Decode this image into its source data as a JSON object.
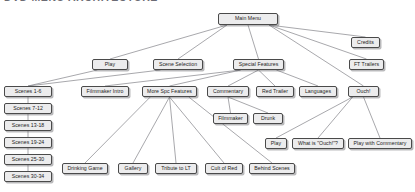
{
  "document": {
    "title_sliver": "DVD MENU ARCHITECTURE"
  },
  "theme": {
    "page_background": "#ffffff",
    "node_fill": "#ececed",
    "node_border": "#4a4a4a",
    "node_text": "#1c1c1c",
    "edge_color": "#6d6d73",
    "shadow": "#5a5a5f"
  },
  "diagram": {
    "type": "tree",
    "root": "main-menu",
    "nodes": [
      {
        "id": "main-menu",
        "label": "Main Menu",
        "x": 218,
        "y": 13,
        "w": 60,
        "h": 12
      },
      {
        "id": "play",
        "label": "Play",
        "x": 92,
        "y": 59,
        "w": 36,
        "h": 11
      },
      {
        "id": "scene-selection",
        "label": "Scene Selection",
        "x": 153,
        "y": 59,
        "w": 50,
        "h": 11
      },
      {
        "id": "special-features",
        "label": "Special Features",
        "x": 233,
        "y": 59,
        "w": 51,
        "h": 11
      },
      {
        "id": "credits",
        "label": "Credits",
        "x": 351,
        "y": 37,
        "w": 29,
        "h": 11
      },
      {
        "id": "ft-trailers",
        "label": "FT Trailers",
        "x": 349,
        "y": 59,
        "w": 35,
        "h": 11
      },
      {
        "id": "scenes-1-6",
        "label": "Scenes 1-6",
        "x": 4,
        "y": 86,
        "w": 48,
        "h": 11
      },
      {
        "id": "scenes-7-12",
        "label": "Scenes 7-12",
        "x": 4,
        "y": 103,
        "w": 48,
        "h": 11
      },
      {
        "id": "scenes-13-18",
        "label": "Scenes 13-18",
        "x": 4,
        "y": 120,
        "w": 48,
        "h": 11
      },
      {
        "id": "scenes-19-24",
        "label": "Scenes 19-24",
        "x": 4,
        "y": 137,
        "w": 48,
        "h": 11
      },
      {
        "id": "scenes-25-30",
        "label": "Scenes 25-30",
        "x": 4,
        "y": 154,
        "w": 48,
        "h": 11
      },
      {
        "id": "scenes-30-34",
        "label": "Scenes 30-34",
        "x": 4,
        "y": 171,
        "w": 48,
        "h": 11
      },
      {
        "id": "filmmaker-intro",
        "label": "Filmmaker Intro",
        "x": 81,
        "y": 86,
        "w": 48,
        "h": 11
      },
      {
        "id": "more-spc-features",
        "label": "More Spc Features",
        "x": 142,
        "y": 86,
        "w": 55,
        "h": 11
      },
      {
        "id": "commentary",
        "label": "Commentary",
        "x": 207,
        "y": 86,
        "w": 42,
        "h": 11
      },
      {
        "id": "red-trailer",
        "label": "Red Trailer",
        "x": 256,
        "y": 86,
        "w": 38,
        "h": 11
      },
      {
        "id": "languages",
        "label": "Languages",
        "x": 299,
        "y": 86,
        "w": 38,
        "h": 11
      },
      {
        "id": "ouch",
        "label": "Ouch!",
        "x": 348,
        "y": 86,
        "w": 31,
        "h": 11
      },
      {
        "id": "filmmaker",
        "label": "Filmmaker",
        "x": 213,
        "y": 113,
        "w": 35,
        "h": 11
      },
      {
        "id": "drunk",
        "label": "Drunk",
        "x": 253,
        "y": 113,
        "w": 30,
        "h": 11
      },
      {
        "id": "ouch-play",
        "label": "Play",
        "x": 265,
        "y": 138,
        "w": 22,
        "h": 11
      },
      {
        "id": "what-is-ouch",
        "label": "What is \"Ouch!\"?",
        "x": 292,
        "y": 138,
        "w": 52,
        "h": 11
      },
      {
        "id": "play-with-comm",
        "label": "Play with Commentary",
        "x": 348,
        "y": 138,
        "w": 64,
        "h": 11
      },
      {
        "id": "drinking-game",
        "label": "Drinking Game",
        "x": 62,
        "y": 163,
        "w": 46,
        "h": 11
      },
      {
        "id": "gallery",
        "label": "Gallery",
        "x": 118,
        "y": 163,
        "w": 30,
        "h": 11
      },
      {
        "id": "tribute-to-lt",
        "label": "Tribute to LT",
        "x": 155,
        "y": 163,
        "w": 42,
        "h": 11
      },
      {
        "id": "cult-of-red",
        "label": "Cult of Red",
        "x": 205,
        "y": 163,
        "w": 38,
        "h": 11
      },
      {
        "id": "behind-scenes",
        "label": "Behind Scenes",
        "x": 249,
        "y": 163,
        "w": 46,
        "h": 11
      }
    ],
    "edges": [
      {
        "from": "main-menu",
        "to": "play"
      },
      {
        "from": "main-menu",
        "to": "scene-selection"
      },
      {
        "from": "main-menu",
        "to": "special-features"
      },
      {
        "from": "main-menu",
        "to": "credits"
      },
      {
        "from": "main-menu",
        "to": "ft-trailers"
      },
      {
        "from": "main-menu",
        "to": "ouch"
      },
      {
        "from": "play",
        "to": "scenes-1-6"
      },
      {
        "from": "scene-selection",
        "to": "scenes-1-6"
      },
      {
        "from": "scenes-1-6",
        "to": "scenes-7-12"
      },
      {
        "from": "scenes-7-12",
        "to": "scenes-13-18"
      },
      {
        "from": "scenes-13-18",
        "to": "scenes-19-24"
      },
      {
        "from": "scenes-19-24",
        "to": "scenes-25-30"
      },
      {
        "from": "scenes-25-30",
        "to": "scenes-30-34"
      },
      {
        "from": "special-features",
        "to": "filmmaker-intro"
      },
      {
        "from": "special-features",
        "to": "more-spc-features"
      },
      {
        "from": "special-features",
        "to": "commentary"
      },
      {
        "from": "special-features",
        "to": "red-trailer"
      },
      {
        "from": "special-features",
        "to": "languages"
      },
      {
        "from": "commentary",
        "to": "filmmaker"
      },
      {
        "from": "commentary",
        "to": "drunk"
      },
      {
        "from": "more-spc-features",
        "to": "drinking-game"
      },
      {
        "from": "more-spc-features",
        "to": "gallery"
      },
      {
        "from": "more-spc-features",
        "to": "tribute-to-lt"
      },
      {
        "from": "more-spc-features",
        "to": "cult-of-red"
      },
      {
        "from": "more-spc-features",
        "to": "behind-scenes"
      },
      {
        "from": "ouch",
        "to": "ouch-play"
      },
      {
        "from": "ouch",
        "to": "what-is-ouch"
      },
      {
        "from": "ouch",
        "to": "play-with-comm"
      }
    ]
  }
}
